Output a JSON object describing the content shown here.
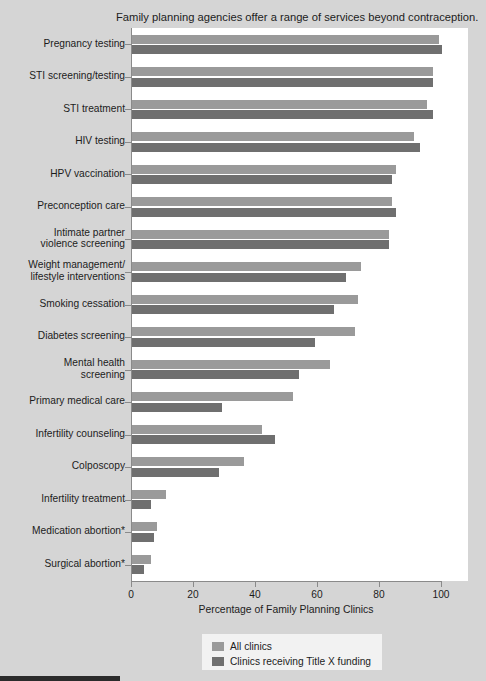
{
  "chart_data": {
    "type": "bar",
    "orientation": "horizontal",
    "title": "Family planning agencies offer a range of services beyond contraception.",
    "xlabel": "Percentage of Family Planning Clinics",
    "ylabel": "",
    "xlim": [
      0,
      100
    ],
    "xticks": [
      0,
      20,
      40,
      60,
      80,
      100
    ],
    "grid": false,
    "legend_position": "bottom-center",
    "categories": [
      "Pregnancy testing",
      "STI screening/testing",
      "STI treatment",
      "HIV testing",
      "HPV vaccination",
      "Preconception care",
      "Intimate partner violence screening",
      "Weight management/ lifestyle interventions",
      "Smoking cessation",
      "Diabetes screening",
      "Mental health screening",
      "Primary medical care",
      "Infertility counseling",
      "Colposcopy",
      "Infertility treatment",
      "Medication abortion*",
      "Surgical abortion*"
    ],
    "series": [
      {
        "name": "All clinics",
        "color": "#9a9a9a",
        "values": [
          99,
          97,
          95,
          91,
          85,
          84,
          83,
          74,
          73,
          72,
          64,
          52,
          42,
          36,
          11,
          8,
          6
        ]
      },
      {
        "name": "Clinics receiving Title X funding",
        "color": "#6f6f6f",
        "values": [
          100,
          97,
          97,
          93,
          84,
          85,
          83,
          69,
          65,
          59,
          54,
          29,
          46,
          28,
          6,
          7,
          4
        ]
      }
    ]
  },
  "legend": {
    "entries": [
      {
        "label": "All clinics"
      },
      {
        "label": "Clinics receiving Title X funding"
      }
    ]
  },
  "axis": {
    "x_tick_labels": [
      "0",
      "20",
      "40",
      "60",
      "80",
      "100"
    ]
  },
  "y_label_lines": [
    [
      "Pregnancy testing"
    ],
    [
      "STI screening/testing"
    ],
    [
      "STI treatment"
    ],
    [
      "HIV testing"
    ],
    [
      "HPV vaccination"
    ],
    [
      "Preconception care"
    ],
    [
      "Intimate partner",
      "violence screening"
    ],
    [
      "Weight management/",
      "lifestyle interventions"
    ],
    [
      "Smoking cessation"
    ],
    [
      "Diabetes screening"
    ],
    [
      "Mental health",
      "screening"
    ],
    [
      "Primary medical care"
    ],
    [
      "Infertility counseling"
    ],
    [
      "Colposcopy"
    ],
    [
      "Infertility treatment"
    ],
    [
      "Medication abortion*"
    ],
    [
      "Surgical abortion*"
    ]
  ]
}
